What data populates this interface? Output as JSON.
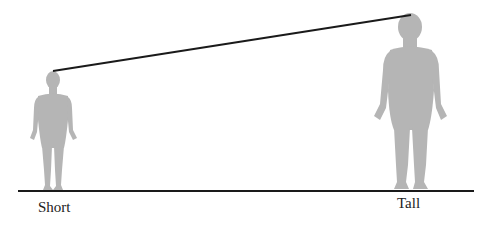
{
  "diagram": {
    "type": "height-comparison",
    "labels": {
      "short": "Short",
      "tall": "Tall"
    },
    "colors": {
      "figure": "#b5b5b5",
      "line": "#1a1a1a",
      "text": "#222222"
    },
    "figures": [
      {
        "name": "short-person",
        "label": "Short",
        "head_top": [
          53,
          71
        ],
        "feet_y": 190
      },
      {
        "name": "tall-person",
        "label": "Tall",
        "head_top": [
          411,
          15
        ],
        "feet_y": 190
      }
    ],
    "ground_line": {
      "x1": 18,
      "x2": 474,
      "y": 191
    },
    "slope_line": {
      "x1": 53,
      "y1": 71,
      "x2": 411,
      "y2": 15
    }
  }
}
